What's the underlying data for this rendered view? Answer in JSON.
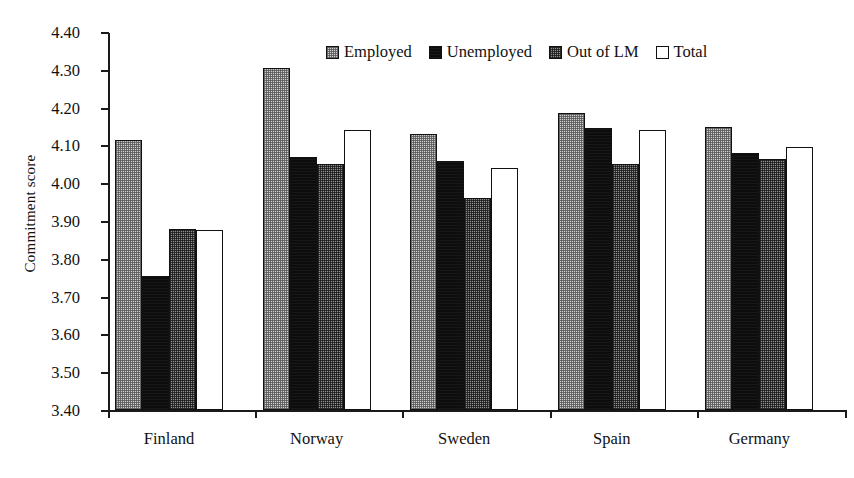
{
  "chart_data": {
    "type": "bar",
    "title": "",
    "xlabel": "",
    "ylabel": "Commitment score",
    "ylim": [
      3.4,
      4.4
    ],
    "ytick_step": 0.1,
    "yticks": [
      "4.40",
      "4.30",
      "4.20",
      "4.10",
      "4.00",
      "3.90",
      "3.80",
      "3.70",
      "3.60",
      "3.50",
      "3.40"
    ],
    "ytick_values": [
      4.4,
      4.3,
      4.2,
      4.1,
      4.0,
      3.9,
      3.8,
      3.7,
      3.6,
      3.5,
      3.4
    ],
    "grid": false,
    "legend_position": "top-center",
    "categories": [
      "Finland",
      "Norway",
      "Sweden",
      "Spain",
      "Germany"
    ],
    "series": [
      {
        "name": "Employed",
        "fill": "light-checker",
        "color": "#cfcfcf",
        "values": [
          4.115,
          4.305,
          4.13,
          4.185,
          4.15
        ]
      },
      {
        "name": "Unemployed",
        "fill": "solid-black",
        "color": "#0d0d0d",
        "values": [
          3.755,
          4.07,
          4.06,
          4.145,
          4.08
        ]
      },
      {
        "name": "Out of LM",
        "fill": "dark-checker",
        "color": "#8e8e8e",
        "values": [
          3.88,
          4.05,
          3.96,
          4.05,
          4.065
        ]
      },
      {
        "name": "Total",
        "fill": "white-outline",
        "color": "#ffffff",
        "values": [
          3.875,
          4.14,
          4.04,
          4.14,
          4.095
        ]
      }
    ]
  },
  "legend": {
    "items": [
      {
        "label": "Employed"
      },
      {
        "label": "Unemployed"
      },
      {
        "label": "Out of LM"
      },
      {
        "label": "Total"
      }
    ]
  },
  "axis": {
    "y_title": "Commitment score"
  }
}
